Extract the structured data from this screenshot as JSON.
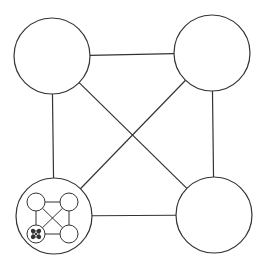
{
  "diagram": {
    "type": "recursive-complete-graph-K4",
    "stroke_color": "#333333",
    "background": "#ffffff",
    "levels": [
      {
        "level": 0,
        "nodes": [
          {
            "id": "top-left",
            "cx": 52,
            "cy": 56,
            "r": 38
          },
          {
            "id": "top-right",
            "cx": 212,
            "cy": 53,
            "r": 38
          },
          {
            "id": "bottom-right",
            "cx": 214,
            "cy": 215,
            "r": 38
          },
          {
            "id": "bottom-left",
            "cx": 54,
            "cy": 216,
            "r": 38,
            "contains": 1
          }
        ]
      },
      {
        "level": 1,
        "nodes": [
          {
            "id": "top-left",
            "cx": 36,
            "cy": 202,
            "r": 9
          },
          {
            "id": "top-right",
            "cx": 69,
            "cy": 202,
            "r": 9
          },
          {
            "id": "bottom-right",
            "cx": 69,
            "cy": 234,
            "r": 9
          },
          {
            "id": "bottom-left",
            "cx": 36,
            "cy": 234,
            "r": 9,
            "contains": 2
          }
        ]
      },
      {
        "level": 2,
        "nodes": [
          {
            "id": "top-left",
            "cx": 33,
            "cy": 231,
            "r": 1.6
          },
          {
            "id": "top-right",
            "cx": 39,
            "cy": 231,
            "r": 1.6
          },
          {
            "id": "bottom-right",
            "cx": 39,
            "cy": 237,
            "r": 1.6
          },
          {
            "id": "bottom-left",
            "cx": 33,
            "cy": 237,
            "r": 1.6
          }
        ]
      }
    ],
    "edges": [
      [
        "top-left",
        "top-right"
      ],
      [
        "top-right",
        "bottom-right"
      ],
      [
        "bottom-right",
        "bottom-left"
      ],
      [
        "bottom-left",
        "top-left"
      ],
      [
        "top-left",
        "bottom-right"
      ],
      [
        "top-right",
        "bottom-left"
      ]
    ]
  }
}
